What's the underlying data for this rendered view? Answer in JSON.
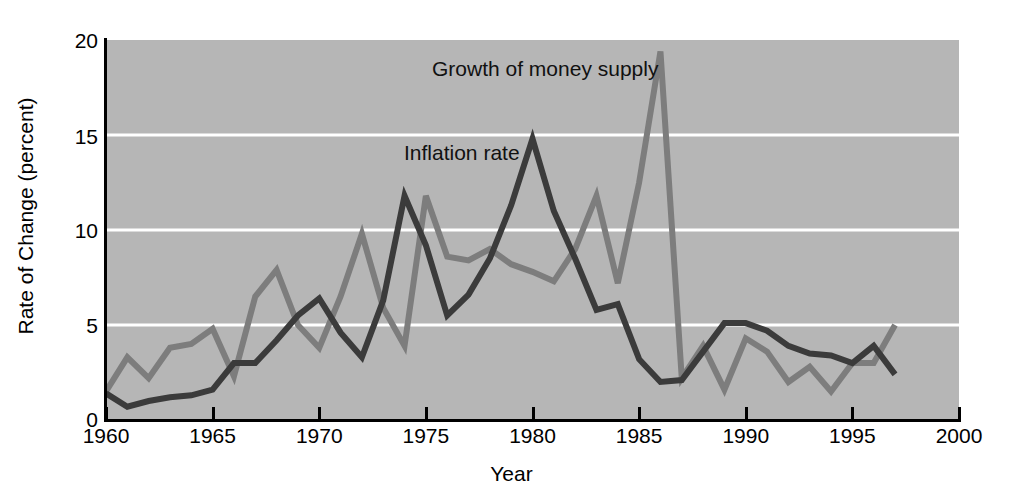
{
  "figure": {
    "background_color": "#ffffff",
    "plot_background_color": "#b6b6b6",
    "gridline_color": "#ffffff",
    "axis_color": "#000000"
  },
  "axes": {
    "x_title": "Year",
    "y_title": "Rate of Change (percent)",
    "x_tick_labels": [
      "1960",
      "1965",
      "1970",
      "1975",
      "1980",
      "1985",
      "1990",
      "1995",
      "2000"
    ],
    "y_tick_labels": [
      "0",
      "5",
      "10",
      "15",
      "20"
    ]
  },
  "annotations": {
    "money_supply_label": "Growth of money supply",
    "inflation_label": "Inflation rate"
  },
  "chart_data": {
    "type": "line",
    "title": "",
    "xlabel": "Year",
    "ylabel": "Rate of Change (percent)",
    "xlim": [
      1960,
      2000
    ],
    "ylim": [
      0,
      20
    ],
    "xticks": [
      1960,
      1965,
      1970,
      1975,
      1980,
      1985,
      1990,
      1995,
      2000
    ],
    "yticks": [
      0,
      5,
      10,
      15,
      20
    ],
    "grid": "horizontal",
    "legend_position": "inline-annotations",
    "x": [
      1960,
      1961,
      1962,
      1963,
      1964,
      1965,
      1966,
      1967,
      1968,
      1969,
      1970,
      1971,
      1972,
      1973,
      1974,
      1975,
      1976,
      1977,
      1978,
      1979,
      1980,
      1981,
      1982,
      1983,
      1984,
      1985,
      1986,
      1987,
      1988,
      1989,
      1990,
      1991,
      1992,
      1993,
      1994,
      1995,
      1996,
      1997
    ],
    "series": [
      {
        "name": "Growth of money supply",
        "color": "#7d7d7d",
        "values": [
          1.5,
          3.3,
          2.2,
          3.8,
          4.0,
          4.8,
          2.3,
          6.5,
          7.9,
          5.0,
          3.8,
          6.5,
          9.8,
          5.9,
          3.9,
          11.8,
          8.6,
          8.4,
          9.0,
          8.2,
          7.8,
          7.3,
          9.0,
          11.8,
          7.2,
          12.5,
          19.4,
          2.2,
          3.9,
          1.6,
          4.3,
          3.6,
          2.0,
          2.8,
          1.5,
          3.0,
          3.0,
          5.0
        ]
      },
      {
        "name": "Inflation rate",
        "color": "#3b3b3b",
        "values": [
          1.4,
          0.7,
          1.0,
          1.2,
          1.3,
          1.6,
          3.0,
          3.0,
          4.2,
          5.5,
          6.4,
          4.6,
          3.3,
          6.3,
          11.8,
          9.2,
          5.5,
          6.6,
          8.5,
          11.3,
          14.8,
          11.0,
          8.5,
          5.8,
          6.1,
          3.2,
          2.0,
          2.1,
          3.6,
          5.1,
          5.1,
          4.7,
          3.9,
          3.5,
          3.4,
          3.0,
          3.9,
          2.4
        ]
      }
    ]
  }
}
